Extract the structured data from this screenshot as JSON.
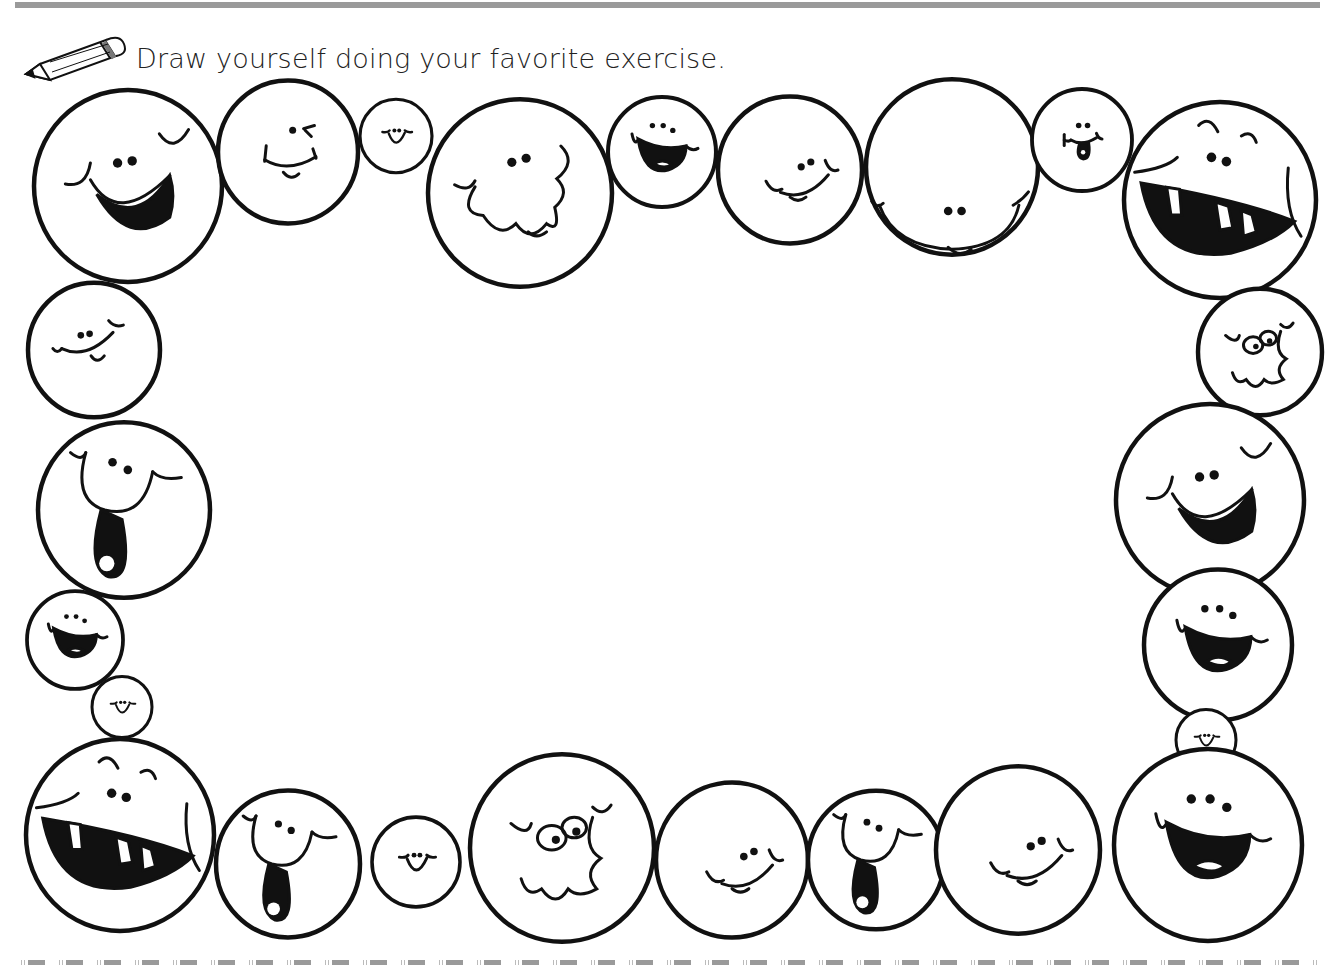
{
  "worksheet": {
    "instruction": "Draw yourself doing your favorite exercise.",
    "instruction_icon": "pencil-icon",
    "drawing_area_label": "Blank drawing area",
    "colors": {
      "ink": "#111111",
      "rule": "#9a9a9a",
      "paper": "#ffffff"
    }
  },
  "faces": [
    {
      "cx": 128,
      "cy": 186,
      "r": 94,
      "style": "big-grin"
    },
    {
      "cx": 288,
      "cy": 152,
      "r": 70,
      "style": "wink"
    },
    {
      "cx": 396,
      "cy": 136,
      "r": 36,
      "style": "small-smile"
    },
    {
      "cx": 520,
      "cy": 193,
      "r": 92,
      "style": "wavy"
    },
    {
      "cx": 662,
      "cy": 152,
      "r": 54,
      "style": "open-mouth"
    },
    {
      "cx": 790,
      "cy": 170,
      "r": 72,
      "style": "smile"
    },
    {
      "cx": 952,
      "cy": 167,
      "r": 86,
      "style": "smile-tongue"
    },
    {
      "cx": 1082,
      "cy": 140,
      "r": 50,
      "style": "tongue-out"
    },
    {
      "cx": 1220,
      "cy": 200,
      "r": 96,
      "style": "toothy-laugh"
    },
    {
      "cx": 94,
      "cy": 350,
      "r": 66,
      "style": "smirk"
    },
    {
      "cx": 1260,
      "cy": 352,
      "r": 62,
      "style": "googly-wavy"
    },
    {
      "cx": 124,
      "cy": 510,
      "r": 86,
      "style": "tongue-down"
    },
    {
      "cx": 1210,
      "cy": 500,
      "r": 94,
      "style": "big-grin"
    },
    {
      "cx": 75,
      "cy": 640,
      "r": 48,
      "style": "open-mouth"
    },
    {
      "cx": 1218,
      "cy": 645,
      "r": 74,
      "style": "open-mouth"
    },
    {
      "cx": 122,
      "cy": 707,
      "r": 30,
      "style": "small-smile"
    },
    {
      "cx": 1206,
      "cy": 740,
      "r": 30,
      "style": "small-smile"
    },
    {
      "cx": 120,
      "cy": 835,
      "r": 94,
      "style": "toothy-laugh"
    },
    {
      "cx": 288,
      "cy": 864,
      "r": 72,
      "style": "tongue-down"
    },
    {
      "cx": 416,
      "cy": 862,
      "r": 44,
      "style": "small-smile"
    },
    {
      "cx": 562,
      "cy": 848,
      "r": 92,
      "style": "googly-wavy"
    },
    {
      "cx": 732,
      "cy": 860,
      "r": 76,
      "style": "smile"
    },
    {
      "cx": 876,
      "cy": 860,
      "r": 68,
      "style": "tongue-down"
    },
    {
      "cx": 1018,
      "cy": 850,
      "r": 82,
      "style": "smile"
    },
    {
      "cx": 1208,
      "cy": 845,
      "r": 94,
      "style": "open-mouth"
    }
  ]
}
